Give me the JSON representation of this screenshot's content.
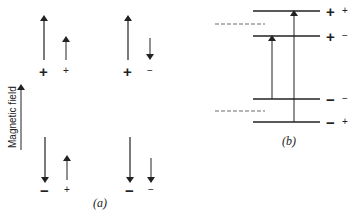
{
  "axis": {
    "label": "Magnetic field"
  },
  "panel_a": {
    "caption": "(a)",
    "states": [
      {
        "electron": "+",
        "nucleus": "+",
        "electron_arrow": "up",
        "nucleus_arrow": "up"
      },
      {
        "electron": "+",
        "nucleus": "−",
        "electron_arrow": "up",
        "nucleus_arrow": "down"
      },
      {
        "electron": "−",
        "nucleus": "+",
        "electron_arrow": "down",
        "nucleus_arrow": "up"
      },
      {
        "electron": "−",
        "nucleus": "−",
        "electron_arrow": "down",
        "nucleus_arrow": "down"
      }
    ]
  },
  "panel_b": {
    "caption": "(b)",
    "levels": [
      {
        "electron": "+",
        "nucleus": "+"
      },
      {
        "electron": "+",
        "nucleus": "−"
      },
      {
        "electron": "−",
        "nucleus": "−"
      },
      {
        "electron": "−",
        "nucleus": "+"
      }
    ],
    "transitions": [
      {
        "from": "− −",
        "to": "+ −"
      },
      {
        "from": "− +",
        "to": "+ +"
      }
    ]
  },
  "colors": {
    "ink": "#222222",
    "background": "#ffffff"
  }
}
